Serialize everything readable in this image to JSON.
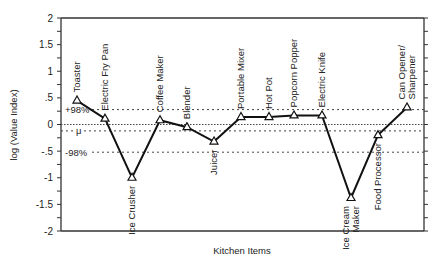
{
  "chart_data": {
    "type": "line",
    "title": "",
    "xlabel": "Kitchen Items",
    "ylabel": "log (Value Index)",
    "ylim": [
      -2,
      2
    ],
    "yticks": [
      2,
      1.5,
      1,
      0.5,
      0,
      -0.5,
      -1,
      -1.5,
      -2
    ],
    "ytick_labels": [
      "2",
      "1.5",
      "1",
      ".5",
      "0",
      "-.5",
      "-1",
      "-1.5",
      "-2"
    ],
    "grid": false,
    "marker": "triangle",
    "categories": [
      "Toaster",
      "Electric Fry Pan",
      "Ice Crusher",
      "Coffee Maker",
      "Blender",
      "Juicer",
      "Portable Mixer",
      "Hot Pot",
      "Popcorn Popper",
      "Electric Knife",
      "Ice Cream Maker",
      "Food Processor",
      "Can Opener/ Sharpener"
    ],
    "category_label_lines": [
      [
        "Toaster"
      ],
      [
        "Electric Fry Pan"
      ],
      [
        "Ice Crusher"
      ],
      [
        "Coffee Maker"
      ],
      [
        "Blender"
      ],
      [
        "Juicer"
      ],
      [
        "Portable Mixer"
      ],
      [
        "Hot Pot"
      ],
      [
        "Popcorn Popper"
      ],
      [
        "Electric Knife"
      ],
      [
        "Ice Cream",
        "Maker"
      ],
      [
        "Food Processor"
      ],
      [
        "Can Opener/",
        "Sharpener"
      ]
    ],
    "category_label_position": [
      "above",
      "above",
      "below",
      "above",
      "above",
      "below",
      "above",
      "above",
      "above",
      "above",
      "below",
      "below",
      "above"
    ],
    "values": [
      0.45,
      0.11,
      -1.0,
      0.08,
      -0.05,
      -0.32,
      0.14,
      0.14,
      0.17,
      0.17,
      -1.38,
      -0.2,
      0.32
    ],
    "reference_lines": [
      {
        "label": "+98%",
        "value": 0.28
      },
      {
        "label": "",
        "value": 0.0
      },
      {
        "label": "μ",
        "value": -0.12
      },
      {
        "label": "-98%",
        "value": -0.52
      }
    ]
  }
}
